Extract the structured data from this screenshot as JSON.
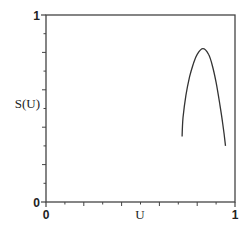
{
  "chart_data": {
    "type": "line",
    "title": "",
    "xlabel": "U",
    "ylabel": "S(U)",
    "xlim": [
      0,
      1
    ],
    "ylim": [
      0,
      1
    ],
    "x_tick_labels": [
      "0",
      "1"
    ],
    "y_tick_labels": [
      "0",
      "1"
    ],
    "grid": false,
    "legend": null,
    "series": [
      {
        "name": "S(U)",
        "x": [
          0.72,
          0.725,
          0.74,
          0.76,
          0.78,
          0.8,
          0.83,
          0.86,
          0.88,
          0.9,
          0.92,
          0.935,
          0.95
        ],
        "y": [
          0.35,
          0.45,
          0.57,
          0.67,
          0.74,
          0.79,
          0.82,
          0.79,
          0.73,
          0.64,
          0.52,
          0.42,
          0.3
        ]
      }
    ],
    "line_color": "#333333"
  }
}
